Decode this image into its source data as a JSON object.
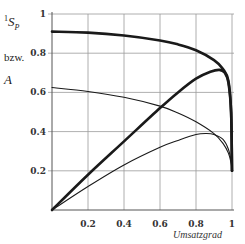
{
  "chart_data": {
    "type": "line",
    "title": "",
    "xlabel": "Umsatzgrad",
    "ylabel": "¹S_p bzw. A",
    "ylabel_parts": {
      "main": "S",
      "sup": "1",
      "sub": "P",
      "middle": "bzw.",
      "second": "A"
    },
    "xlim": [
      0,
      1
    ],
    "ylim": [
      0,
      1
    ],
    "x_ticks": [
      "0.2",
      "0.4",
      "0.6",
      "0.8",
      "1"
    ],
    "y_ticks": [
      "0.2",
      "0.4",
      "0.6",
      "0.8",
      "1"
    ],
    "grid": true,
    "legend": null,
    "series": [
      {
        "name": "S_p (thick)",
        "style": "thick",
        "x": [
          0,
          0.2,
          0.4,
          0.6,
          0.7,
          0.8,
          0.9,
          0.95,
          0.98,
          0.995,
          1.0
        ],
        "y": [
          0.91,
          0.905,
          0.89,
          0.865,
          0.845,
          0.815,
          0.765,
          0.72,
          0.66,
          0.5,
          0.2
        ]
      },
      {
        "name": "A (thick)",
        "style": "thick",
        "x": [
          0,
          0.2,
          0.4,
          0.6,
          0.7,
          0.8,
          0.88,
          0.93,
          0.96,
          0.98,
          0.995,
          1.0
        ],
        "y": [
          0,
          0.18,
          0.35,
          0.52,
          0.6,
          0.67,
          0.705,
          0.715,
          0.7,
          0.65,
          0.5,
          0.2
        ]
      },
      {
        "name": "S_p (thin)",
        "style": "thin",
        "x": [
          0,
          0.2,
          0.4,
          0.6,
          0.7,
          0.8,
          0.9,
          0.95,
          0.98,
          0.995,
          1.0
        ],
        "y": [
          0.625,
          0.605,
          0.575,
          0.53,
          0.495,
          0.45,
          0.39,
          0.34,
          0.29,
          0.24,
          0.2
        ]
      },
      {
        "name": "A (thin)",
        "style": "thin",
        "x": [
          0,
          0.2,
          0.4,
          0.6,
          0.7,
          0.8,
          0.86,
          0.9,
          0.95,
          0.98,
          0.995,
          1.0
        ],
        "y": [
          0,
          0.12,
          0.23,
          0.32,
          0.355,
          0.385,
          0.39,
          0.385,
          0.36,
          0.31,
          0.25,
          0.2
        ]
      }
    ]
  }
}
